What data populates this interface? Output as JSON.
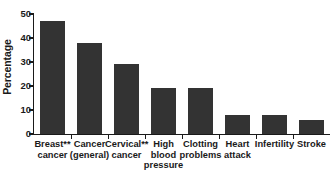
{
  "chart_data": {
    "type": "bar",
    "title": "",
    "subtitle": "",
    "xlabel": "",
    "ylabel": "Percentage",
    "ylim": [
      0,
      50
    ],
    "yticks": [
      0,
      10,
      20,
      30,
      40,
      50
    ],
    "ytick_labels": [
      "0",
      "10",
      "20",
      "30",
      "40",
      "50"
    ],
    "grid": false,
    "legend": null,
    "bar_color": "#333333",
    "axis_color": "#1a1a1a",
    "categories": [
      "Breast**\ncancer",
      "Cancer\n(general)",
      "Cervical**\ncancer",
      "High\nblood\npressure",
      "Clotting\nproblems",
      "Heart\nattack",
      "Infertility",
      "Stroke"
    ],
    "values": [
      47,
      38,
      29,
      19,
      19,
      8,
      8,
      6
    ],
    "annotations": []
  }
}
